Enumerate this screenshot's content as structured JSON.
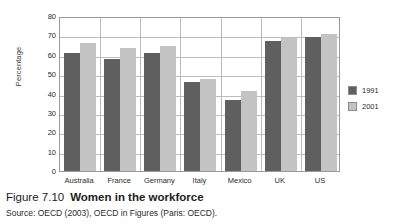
{
  "chart_data": {
    "type": "bar",
    "title": "Women in the workforce",
    "xlabel": "",
    "ylabel": "Percentage",
    "ylim": [
      0,
      80
    ],
    "yticks": [
      0,
      10,
      20,
      30,
      40,
      50,
      60,
      70,
      80
    ],
    "grid": true,
    "legend_position": "right",
    "categories": [
      "Australia",
      "France",
      "Germany",
      "Italy",
      "Mexico",
      "UK",
      "US"
    ],
    "series": [
      {
        "name": "1991",
        "color": "#5f5f5f",
        "values": [
          61,
          58,
          61,
          46,
          36.5,
          67,
          69
        ]
      },
      {
        "name": "2001",
        "color": "#c3c3c3",
        "values": [
          66,
          63.5,
          64.5,
          47.5,
          41.5,
          68.5,
          70.5
        ]
      }
    ]
  },
  "caption": {
    "number": "Figure 7.10",
    "title": "Women in the workforce",
    "source": "Source: OECD (2003), OECD in Figures (Paris: OECD)."
  }
}
